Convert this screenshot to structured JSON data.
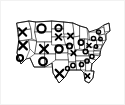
{
  "image": {
    "title": "United States map overlaid with tic-tac-toe X and O marks",
    "alt_text": "Black and white outline map of the United States with bold X and O symbols drawn over the states",
    "background_color": "#ffffff",
    "border_color": "#f2f2f2",
    "line_color": "#1a1a1a",
    "mark_color": "#000000",
    "width": 125,
    "height": 105
  },
  "map": {
    "name": "united-states",
    "style": "outline",
    "stroke_color": "#1a1a1a",
    "fill_color": "#ffffff"
  },
  "marks": [
    {
      "id": "mark-1",
      "symbol": "X",
      "x": 21.5,
      "y": 31.0,
      "size": 8.0,
      "weight": 2.1,
      "region": "washington"
    },
    {
      "id": "mark-2",
      "symbol": "O",
      "x": 40.5,
      "y": 27.5,
      "size": 8.2,
      "weight": 2.2,
      "region": "montana"
    },
    {
      "id": "mark-3",
      "symbol": "O",
      "x": 57.5,
      "y": 27.0,
      "size": 6.4,
      "weight": 1.9,
      "region": "north-dakota"
    },
    {
      "id": "mark-4",
      "symbol": "X",
      "x": 57.5,
      "y": 36.0,
      "size": 6.2,
      "weight": 1.9,
      "region": "south-dakota"
    },
    {
      "id": "mark-5",
      "symbol": "X",
      "x": 22.0,
      "y": 44.5,
      "size": 8.4,
      "weight": 2.2,
      "region": "california-north"
    },
    {
      "id": "mark-6",
      "symbol": "O",
      "x": 19.0,
      "y": 57.0,
      "size": 6.2,
      "weight": 2.0,
      "region": "california-south"
    },
    {
      "id": "mark-7",
      "symbol": "X",
      "x": 43.0,
      "y": 48.0,
      "size": 8.6,
      "weight": 2.3,
      "region": "wyoming-colorado"
    },
    {
      "id": "mark-8",
      "symbol": "O",
      "x": 58.0,
      "y": 48.0,
      "size": 7.4,
      "weight": 2.2,
      "region": "nebraska-kansas"
    },
    {
      "id": "mark-9",
      "symbol": "O",
      "x": 42.0,
      "y": 60.5,
      "size": 7.6,
      "weight": 2.3,
      "region": "new-mexico-arizona"
    },
    {
      "id": "mark-10",
      "symbol": "X",
      "x": 58.5,
      "y": 72.5,
      "size": 8.2,
      "weight": 2.3,
      "region": "texas"
    },
    {
      "id": "mark-11",
      "symbol": "X",
      "x": 69.5,
      "y": 35.0,
      "size": 5.8,
      "weight": 1.8,
      "region": "minnesota-wisconsin"
    },
    {
      "id": "mark-12",
      "symbol": "O",
      "x": 68.5,
      "y": 45.0,
      "size": 5.4,
      "weight": 1.8,
      "region": "iowa-missouri"
    },
    {
      "id": "mark-13",
      "symbol": "X",
      "x": 72.5,
      "y": 52.0,
      "size": 5.0,
      "weight": 1.7,
      "region": "illinois-kentucky"
    },
    {
      "id": "mark-14",
      "symbol": "O",
      "x": 80.0,
      "y": 41.5,
      "size": 5.2,
      "weight": 1.7,
      "region": "michigan"
    },
    {
      "id": "mark-15",
      "symbol": "O",
      "x": 84.5,
      "y": 50.5,
      "size": 4.6,
      "weight": 1.6,
      "region": "ohio-west-virginia"
    },
    {
      "id": "mark-16",
      "symbol": "X",
      "x": 88.0,
      "y": 44.5,
      "size": 4.4,
      "weight": 1.6,
      "region": "pennsylvania"
    },
    {
      "id": "mark-17",
      "symbol": "O",
      "x": 92.5,
      "y": 37.5,
      "size": 4.2,
      "weight": 1.5,
      "region": "new-york"
    },
    {
      "id": "mark-18",
      "symbol": "O",
      "x": 97.5,
      "y": 31.0,
      "size": 4.0,
      "weight": 1.5,
      "region": "new-england-north"
    },
    {
      "id": "mark-19",
      "symbol": "O",
      "x": 99.5,
      "y": 38.0,
      "size": 3.6,
      "weight": 1.4,
      "region": "new-england-south"
    },
    {
      "id": "mark-20",
      "symbol": "O",
      "x": 95.0,
      "y": 45.5,
      "size": 3.6,
      "weight": 1.4,
      "region": "mid-atlantic"
    },
    {
      "id": "mark-21",
      "symbol": "O",
      "x": 91.0,
      "y": 55.5,
      "size": 4.0,
      "weight": 1.5,
      "region": "virginia-carolina"
    },
    {
      "id": "mark-22",
      "symbol": "O",
      "x": 86.0,
      "y": 60.0,
      "size": 4.2,
      "weight": 1.5,
      "region": "north-carolina"
    },
    {
      "id": "mark-23",
      "symbol": "O",
      "x": 80.5,
      "y": 63.5,
      "size": 4.2,
      "weight": 1.5,
      "region": "georgia-south-carolina"
    },
    {
      "id": "mark-24",
      "symbol": "O",
      "x": 72.0,
      "y": 64.5,
      "size": 4.4,
      "weight": 1.6,
      "region": "alabama-mississippi"
    },
    {
      "id": "mark-25",
      "symbol": "O",
      "x": 66.5,
      "y": 67.5,
      "size": 4.0,
      "weight": 1.5,
      "region": "louisiana-arkansas"
    },
    {
      "id": "mark-26",
      "symbol": "X",
      "x": 86.5,
      "y": 75.0,
      "size": 4.6,
      "weight": 1.6,
      "region": "florida"
    }
  ]
}
